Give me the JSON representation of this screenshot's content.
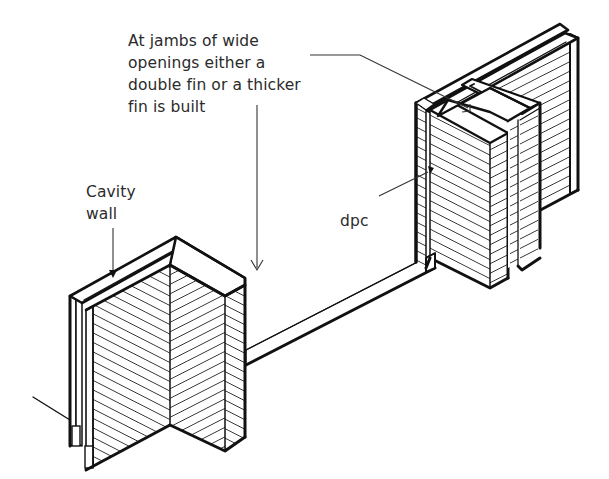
{
  "figure": {
    "annotations": {
      "jambs": {
        "lines": [
          "At jambs of wide",
          "openings either a",
          "double fin or a thicker",
          "fin is built"
        ]
      },
      "cavity_wall": {
        "lines": [
          "Cavity",
          "wall"
        ]
      },
      "dpc": {
        "lines": [
          "dpc"
        ]
      }
    },
    "elements": [
      {
        "name": "left-fin-pier",
        "type": "single thick fin with cavity wall"
      },
      {
        "name": "right-double-fin-pier",
        "type": "double fin with cavity wall"
      },
      {
        "name": "connecting-wall-base",
        "type": "low wall / sill between piers"
      }
    ],
    "colors": {
      "ink": "#111111",
      "text": "#2b2b2b",
      "background": "#ffffff"
    }
  }
}
